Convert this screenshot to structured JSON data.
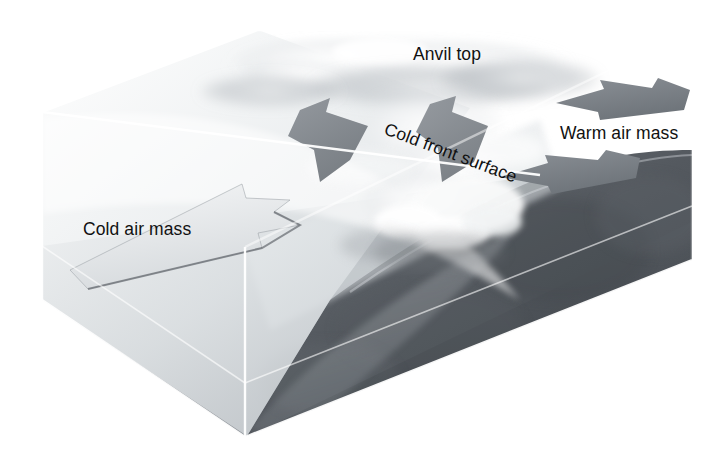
{
  "figure": {
    "background_color": "#ffffff"
  },
  "labels": {
    "anvil_top": "Anvil top",
    "warm_air_mass": "Warm air mass",
    "cold_front_surface": "Cold front surface",
    "cold_air_mass": "Cold air mass"
  },
  "colors": {
    "label_text": "#111111",
    "cold_air_block": "#e9ecef",
    "cold_air_block_shadow": "#c3c8cc",
    "ground_slab_top": "#8f949a",
    "ground_slab_front": "#7e848a",
    "ground_slab_left": "#9aa0a5",
    "terrain_dark": "#4c5156",
    "terrain_mid": "#6b7076",
    "cloud_white": "#fbfbfc",
    "arrow_dark": "#7a7f85",
    "arrow_light": "#dfe3e6",
    "edge_line": "#ffffff"
  },
  "block": {
    "top_face_corners": "(42,112) (258,30) (692,30) (540,175)",
    "left_face_corners": "(42,112) (42,300) (245,437) (245,247)",
    "front_face_corners": "(245,247) (245,437) (692,260) (692,30)"
  },
  "arrows": [
    {
      "name": "cold-air-surge-arrow",
      "direction": "right",
      "tone": "light",
      "description": "Large pale wedge arrow advancing from the cold air mass toward the front"
    },
    {
      "name": "warm-air-upper-arrow",
      "direction": "left",
      "tone": "dark",
      "description": "Upper dark arrow showing warm air flowing toward the front"
    },
    {
      "name": "warm-air-lower-arrow",
      "direction": "left",
      "tone": "dark",
      "description": "Lower dark arrow showing warm air flowing toward the front"
    },
    {
      "name": "updraft-arrow-left",
      "direction": "up",
      "tone": "dark",
      "description": "Dark arrow showing forced uplift of warm air along the frontal surface"
    },
    {
      "name": "updraft-arrow-right",
      "direction": "up",
      "tone": "dark",
      "description": "Second dark arrow showing uplift into the cumulonimbus tower"
    }
  ],
  "features": [
    {
      "name": "anvil-cloud",
      "description": "Broad flattened cirrus anvil spreading along the top of the block"
    },
    {
      "name": "cumulonimbus-tower",
      "description": "Towering convective cloud rising above the frontal boundary"
    },
    {
      "name": "cold-front-surface-plane",
      "description": "Sloping boundary plane separating cold air from warm air"
    },
    {
      "name": "ground-slab",
      "description": "Terrain slab forming the base of the block diagram"
    }
  ]
}
